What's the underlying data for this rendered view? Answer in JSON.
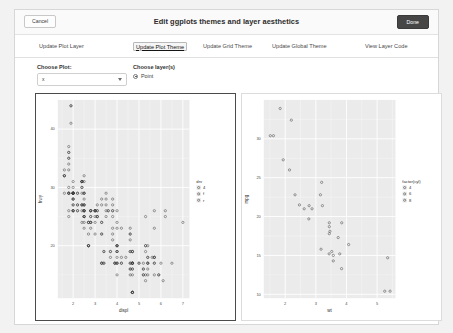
{
  "header": {
    "title": "Edit ggplots themes and layer aesthetics",
    "cancel_label": "Cancel",
    "done_label": "Done"
  },
  "tabs": [
    {
      "label": "Update Plot Layer",
      "active": false
    },
    {
      "label": "Update Plot Theme",
      "active": true
    },
    {
      "label": "Update Grid Theme",
      "active": false
    },
    {
      "label": "Update Global Theme",
      "active": false
    },
    {
      "label": "View Layer Code",
      "active": false
    }
  ],
  "controls": {
    "plot_label": "Choose Plot:",
    "plot_value": "x",
    "layer_label": "Choose layer(s)",
    "layer_option": "Point"
  },
  "theme": {
    "panel_fill": "#ebebeb",
    "grid_major": "#ffffff",
    "grid_minor": "#f7f7f7",
    "point_color": "#3d3d3d",
    "axis_text": "#4d4d4d",
    "selected_border": "#4b4b4b"
  },
  "chart_data": [
    {
      "type": "scatter",
      "id": "plot-left",
      "title": "",
      "xlabel": "displ",
      "ylabel": "hwy",
      "xlim": [
        1.3,
        7.3
      ],
      "ylim": [
        11,
        45
      ],
      "xticks": [
        2,
        3,
        4,
        5,
        6,
        7
      ],
      "yticks": [
        20,
        30,
        40
      ],
      "grid": true,
      "legend": {
        "title": "drv",
        "position": "right",
        "entries": [
          "4",
          "f",
          "r"
        ]
      },
      "x": [
        1.8,
        1.8,
        2.0,
        2.0,
        2.8,
        2.8,
        3.1,
        1.8,
        1.8,
        2.0,
        2.0,
        2.8,
        2.8,
        3.1,
        3.1,
        2.8,
        3.1,
        4.2,
        5.3,
        5.3,
        5.3,
        5.7,
        6.0,
        5.7,
        5.7,
        6.2,
        6.2,
        7.0,
        5.3,
        5.3,
        5.7,
        6.5,
        2.4,
        2.4,
        3.1,
        3.5,
        3.6,
        2.4,
        3.0,
        3.3,
        3.3,
        3.3,
        3.3,
        3.3,
        3.8,
        3.8,
        3.8,
        4.0,
        3.7,
        3.7,
        3.9,
        3.9,
        4.7,
        4.7,
        4.7,
        5.2,
        5.2,
        3.9,
        4.7,
        4.7,
        4.7,
        5.2,
        5.7,
        5.9,
        4.7,
        4.7,
        4.7,
        4.7,
        4.7,
        4.7,
        5.2,
        5.2,
        5.7,
        5.9,
        4.6,
        5.4,
        5.4,
        4.0,
        4.0,
        4.0,
        4.0,
        4.6,
        5.0,
        4.2,
        4.2,
        4.6,
        4.6,
        4.6,
        5.4,
        5.4,
        3.8,
        3.8,
        4.0,
        4.0,
        4.6,
        4.6,
        4.6,
        4.6,
        5.4,
        1.6,
        1.6,
        1.6,
        1.6,
        1.6,
        1.8,
        1.8,
        1.8,
        2.0,
        2.4,
        2.4,
        2.4,
        2.4,
        2.5,
        2.5,
        3.3,
        2.0,
        2.0,
        2.0,
        2.0,
        2.7,
        2.7,
        2.7,
        3.0,
        3.7,
        4.0,
        4.7,
        4.7,
        4.7,
        5.7,
        6.1,
        4.0,
        4.2,
        4.4,
        4.6,
        5.4,
        5.4,
        5.4,
        4.0,
        4.0,
        4.6,
        5.0,
        2.4,
        2.4,
        2.5,
        2.5,
        3.5,
        3.5,
        3.0,
        3.0,
        3.5,
        3.3,
        3.3,
        4.0,
        5.6,
        3.1,
        3.8,
        3.8,
        3.8,
        5.3,
        2.5,
        2.5,
        2.5,
        2.5,
        2.5,
        2.5,
        2.2,
        2.2,
        2.5,
        2.5,
        2.5,
        2.5,
        2.5,
        2.5,
        2.7,
        2.7,
        3.4,
        3.4,
        4.0,
        4.7,
        2.2,
        2.2,
        2.4,
        2.4,
        3.0,
        3.0,
        3.5,
        2.2,
        2.2,
        2.4,
        2.4,
        3.0,
        3.0,
        3.3,
        1.8,
        1.8,
        1.8,
        1.8,
        1.8,
        4.7,
        5.7,
        2.7,
        2.7,
        2.7,
        3.4,
        3.4,
        4.0,
        4.0,
        2.0,
        2.0,
        2.0,
        2.0,
        2.8,
        1.9,
        2.0,
        2.0,
        2.0,
        2.0,
        2.5,
        2.5,
        2.8,
        2.8,
        1.9,
        1.9,
        2.0,
        2.0,
        2.5,
        2.5,
        1.8,
        1.8,
        2.0,
        2.0,
        2.8,
        2.8,
        3.6
      ],
      "y": [
        29,
        29,
        31,
        30,
        26,
        26,
        27,
        26,
        25,
        28,
        27,
        25,
        25,
        25,
        25,
        24,
        25,
        23,
        20,
        15,
        20,
        17,
        17,
        26,
        23,
        26,
        25,
        24,
        19,
        14,
        15,
        17,
        27,
        30,
        26,
        29,
        26,
        24,
        24,
        22,
        22,
        24,
        24,
        17,
        22,
        21,
        23,
        23,
        19,
        18,
        17,
        17,
        19,
        19,
        12,
        17,
        15,
        17,
        17,
        12,
        17,
        16,
        18,
        15,
        16,
        12,
        17,
        17,
        16,
        12,
        15,
        16,
        17,
        15,
        17,
        17,
        18,
        17,
        19,
        17,
        19,
        19,
        17,
        17,
        17,
        16,
        16,
        17,
        15,
        17,
        26,
        25,
        26,
        24,
        21,
        22,
        23,
        22,
        20,
        33,
        32,
        32,
        29,
        32,
        34,
        36,
        36,
        29,
        26,
        27,
        30,
        31,
        26,
        26,
        28,
        26,
        29,
        28,
        27,
        24,
        24,
        24,
        22,
        19,
        20,
        17,
        12,
        19,
        18,
        14,
        15,
        18,
        18,
        15,
        17,
        16,
        18,
        17,
        19,
        19,
        17,
        29,
        27,
        31,
        32,
        27,
        26,
        26,
        25,
        25,
        17,
        17,
        20,
        18,
        26,
        26,
        27,
        28,
        25,
        25,
        24,
        27,
        25,
        26,
        23,
        26,
        26,
        26,
        26,
        25,
        27,
        25,
        27,
        20,
        20,
        19,
        17,
        20,
        17,
        29,
        27,
        31,
        31,
        26,
        26,
        28,
        27,
        29,
        31,
        31,
        26,
        26,
        27,
        30,
        33,
        35,
        37,
        35,
        15,
        18,
        20,
        20,
        22,
        17,
        19,
        18,
        20,
        29,
        26,
        29,
        29,
        24,
        44,
        29,
        26,
        29,
        29,
        29,
        29,
        23,
        24,
        44,
        41,
        29,
        26,
        28,
        29,
        29,
        29,
        28,
        29,
        26,
        26,
        26
      ],
      "group": [
        "f",
        "f",
        "f",
        "f",
        "f",
        "f",
        "f",
        "4",
        "4",
        "4",
        "4",
        "4",
        "4",
        "4",
        "4",
        "4",
        "4",
        "4",
        "4",
        "4",
        "4",
        "r",
        "r",
        "r",
        "r",
        "r",
        "r",
        "r",
        "4",
        "4",
        "4",
        "4",
        "4",
        "4",
        "4",
        "4",
        "4",
        "4",
        "4",
        "4",
        "4",
        "4",
        "4",
        "4",
        "4",
        "4",
        "4",
        "4",
        "4",
        "4",
        "4",
        "4",
        "4",
        "4",
        "4",
        "4",
        "4",
        "4",
        "4",
        "4",
        "4",
        "4",
        "4",
        "4",
        "4",
        "4",
        "4",
        "4",
        "4",
        "4",
        "4",
        "4",
        "4",
        "4",
        "4",
        "4",
        "4",
        "4",
        "4",
        "4",
        "4",
        "4",
        "4",
        "4",
        "4",
        "4",
        "4",
        "4",
        "4",
        "4",
        "r",
        "r",
        "r",
        "r",
        "r",
        "r",
        "r",
        "r",
        "r",
        "f",
        "f",
        "f",
        "f",
        "f",
        "f",
        "f",
        "f",
        "f",
        "f",
        "f",
        "f",
        "f",
        "f",
        "f",
        "f",
        "4",
        "4",
        "4",
        "4",
        "4",
        "4",
        "4",
        "4",
        "4",
        "4",
        "4",
        "4",
        "4",
        "r",
        "r",
        "4",
        "4",
        "4",
        "4",
        "4",
        "4",
        "4",
        "4",
        "4",
        "4",
        "4",
        "f",
        "f",
        "f",
        "f",
        "f",
        "f",
        "4",
        "4",
        "4",
        "f",
        "f",
        "f",
        "f",
        "4",
        "4",
        "4",
        "4",
        "4",
        "f",
        "f",
        "f",
        "f",
        "f",
        "f",
        "f",
        "f",
        "f",
        "f",
        "f",
        "f",
        "f",
        "f",
        "f",
        "f",
        "f",
        "f",
        "f",
        "f",
        "f",
        "f",
        "f",
        "f",
        "f",
        "f",
        "f",
        "f",
        "f",
        "f",
        "f",
        "f",
        "f",
        "f",
        "f",
        "f",
        "f",
        "f",
        "f",
        "r",
        "r",
        "4",
        "4",
        "4",
        "4",
        "4",
        "4",
        "4",
        "f",
        "f",
        "f",
        "f",
        "f",
        "f",
        "f",
        "f",
        "f",
        "f",
        "f",
        "f",
        "f",
        "f",
        "f",
        "f",
        "f",
        "f",
        "f",
        "f",
        "f",
        "f",
        "f",
        "f",
        "f",
        "f",
        "f"
      ]
    },
    {
      "type": "scatter",
      "id": "plot-right",
      "title": "",
      "xlabel": "wt",
      "ylabel": "mpg",
      "xlim": [
        1.3,
        5.6
      ],
      "ylim": [
        9.5,
        35
      ],
      "xticks": [
        2,
        3,
        4,
        5
      ],
      "yticks": [
        10,
        15,
        20,
        25,
        30
      ],
      "grid": true,
      "legend": {
        "title": "factor(cyl)",
        "position": "right",
        "entries": [
          "4",
          "6",
          "8"
        ]
      },
      "x": [
        2.62,
        2.875,
        2.32,
        3.215,
        3.44,
        3.46,
        3.57,
        3.19,
        3.15,
        3.44,
        3.44,
        4.07,
        3.73,
        3.78,
        5.25,
        5.424,
        5.345,
        2.2,
        1.615,
        1.835,
        2.465,
        3.52,
        3.435,
        3.84,
        3.845,
        1.935,
        2.14,
        1.513,
        3.17,
        2.77,
        3.57,
        2.78
      ],
      "y": [
        21.0,
        21.0,
        22.8,
        21.4,
        18.7,
        18.1,
        14.3,
        24.4,
        22.8,
        19.2,
        17.8,
        16.4,
        17.3,
        15.2,
        10.4,
        10.4,
        14.7,
        32.4,
        30.4,
        33.9,
        21.5,
        15.5,
        15.2,
        13.3,
        19.2,
        27.3,
        26.0,
        30.4,
        15.8,
        19.7,
        15.0,
        21.4
      ],
      "group": [
        "6",
        "6",
        "4",
        "6",
        "8",
        "6",
        "8",
        "4",
        "4",
        "6",
        "6",
        "8",
        "8",
        "8",
        "8",
        "8",
        "8",
        "4",
        "4",
        "4",
        "4",
        "8",
        "8",
        "8",
        "8",
        "4",
        "4",
        "4",
        "8",
        "6",
        "8",
        "4"
      ]
    }
  ]
}
